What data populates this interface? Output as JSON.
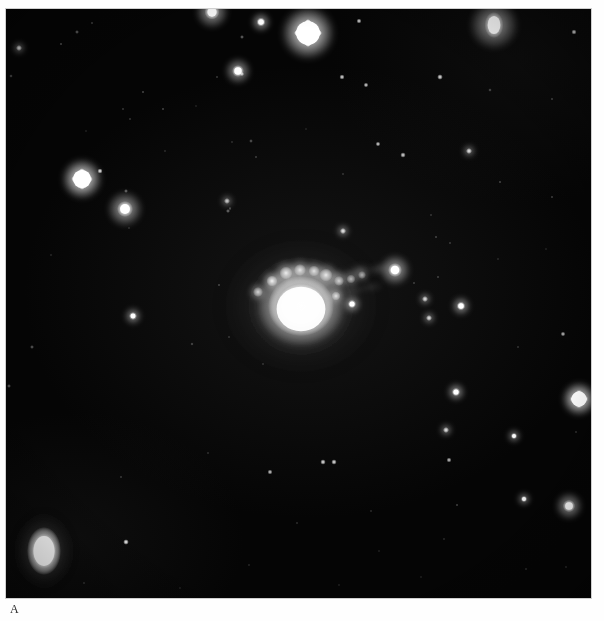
{
  "figure": {
    "panel_letter": "A",
    "panel_letter_x": 10,
    "panel_letter_y": 603,
    "page_background": "#ffffff"
  },
  "plate": {
    "name": "astronomical-photographic-plate",
    "x": 6,
    "y": 9,
    "width": 585,
    "height": 589,
    "sky_background": "#050505",
    "star_color": "#ffffff",
    "subject": "bright-peculiar-galaxy-with-knotty-tail",
    "orientation_note": "negative-inverted grayscale sky survey print"
  },
  "chart_data": {
    "type": "scatter",
    "title": "",
    "xlabel": "",
    "ylabel": "",
    "xlim": [
      0,
      585
    ],
    "ylim": [
      0,
      589
    ],
    "grid": false,
    "legend": false,
    "coordinate_space": "plate-pixels, origin at plate top-left",
    "central_object": {
      "label": "peculiar galaxy core",
      "cx": 295,
      "cy": 297,
      "core_rx": 33,
      "core_ry": 30,
      "halo_rx": 62,
      "halo_ry": 58,
      "peak_brightness": 1.0,
      "knots": [
        {
          "cx": 266,
          "cy": 272,
          "r": 5.5,
          "b": 0.92
        },
        {
          "cx": 280,
          "cy": 264,
          "r": 6.5,
          "b": 0.86
        },
        {
          "cx": 294,
          "cy": 261,
          "r": 6.0,
          "b": 0.8
        },
        {
          "cx": 308,
          "cy": 262,
          "r": 5.5,
          "b": 0.78
        },
        {
          "cx": 320,
          "cy": 266,
          "r": 6.5,
          "b": 0.84
        },
        {
          "cx": 333,
          "cy": 272,
          "r": 5.0,
          "b": 0.7
        },
        {
          "cx": 345,
          "cy": 270,
          "r": 4.5,
          "b": 0.6
        },
        {
          "cx": 356,
          "cy": 266,
          "r": 4.0,
          "b": 0.55
        },
        {
          "cx": 252,
          "cy": 283,
          "r": 5.0,
          "b": 0.72
        },
        {
          "cx": 330,
          "cy": 287,
          "r": 4.5,
          "b": 0.78
        }
      ],
      "tail": {
        "label": "wispy tidal tail / jet toward upper right",
        "points": [
          {
            "cx": 330,
            "cy": 268,
            "rx": 16,
            "ry": 9,
            "b": 0.42,
            "rot": -18
          },
          {
            "cx": 352,
            "cy": 262,
            "rx": 16,
            "ry": 8,
            "b": 0.36,
            "rot": -16
          },
          {
            "cx": 372,
            "cy": 260,
            "rx": 14,
            "ry": 7,
            "b": 0.3,
            "rot": -12
          },
          {
            "cx": 345,
            "cy": 282,
            "rx": 18,
            "ry": 7,
            "b": 0.26,
            "rot": -8
          },
          {
            "cx": 366,
            "cy": 278,
            "rx": 14,
            "ry": 6,
            "b": 0.2,
            "rot": -6
          }
        ]
      }
    },
    "bright_companion": {
      "label": "elongated bright object lower left",
      "cx": 38,
      "cy": 542,
      "rx": 17,
      "ry": 24,
      "b": 1.0
    },
    "stars": [
      {
        "x": 71,
        "y": 23,
        "r": 2.0,
        "b": 0.55,
        "shape": "round"
      },
      {
        "x": 86,
        "y": 14,
        "r": 1.4,
        "b": 0.4,
        "shape": "round"
      },
      {
        "x": 206,
        "y": 3,
        "r": 7.5,
        "b": 1.0,
        "shape": "round"
      },
      {
        "x": 255,
        "y": 13,
        "r": 4.5,
        "b": 0.95,
        "shape": "round"
      },
      {
        "x": 302,
        "y": 24,
        "r": 12.5,
        "b": 1.0,
        "shape": "diamond"
      },
      {
        "x": 488,
        "y": 16,
        "r": 11.0,
        "b": 1.0,
        "shape": "oval"
      },
      {
        "x": 353,
        "y": 12,
        "r": 2.5,
        "b": 0.7,
        "shape": "round"
      },
      {
        "x": 568,
        "y": 23,
        "r": 2.6,
        "b": 0.78,
        "shape": "round"
      },
      {
        "x": 13,
        "y": 39,
        "r": 3.0,
        "b": 0.75,
        "shape": "round"
      },
      {
        "x": 55,
        "y": 35,
        "r": 1.6,
        "b": 0.45,
        "shape": "round"
      },
      {
        "x": 5,
        "y": 67,
        "r": 1.8,
        "b": 0.45,
        "shape": "round"
      },
      {
        "x": 236,
        "y": 28,
        "r": 2.0,
        "b": 0.55,
        "shape": "round"
      },
      {
        "x": 232,
        "y": 62,
        "r": 6.0,
        "b": 0.95,
        "shape": "round"
      },
      {
        "x": 336,
        "y": 68,
        "r": 2.6,
        "b": 0.72,
        "shape": "round"
      },
      {
        "x": 360,
        "y": 76,
        "r": 2.4,
        "b": 0.68,
        "shape": "round"
      },
      {
        "x": 211,
        "y": 68,
        "r": 1.4,
        "b": 0.35,
        "shape": "round"
      },
      {
        "x": 137,
        "y": 83,
        "r": 1.6,
        "b": 0.4,
        "shape": "round"
      },
      {
        "x": 117,
        "y": 100,
        "r": 1.4,
        "b": 0.34,
        "shape": "round"
      },
      {
        "x": 236,
        "y": 65,
        "r": 2.2,
        "b": 0.6,
        "shape": "round"
      },
      {
        "x": 434,
        "y": 68,
        "r": 2.8,
        "b": 0.76,
        "shape": "round"
      },
      {
        "x": 484,
        "y": 81,
        "r": 1.8,
        "b": 0.42,
        "shape": "round"
      },
      {
        "x": 546,
        "y": 90,
        "r": 1.6,
        "b": 0.38,
        "shape": "round"
      },
      {
        "x": 157,
        "y": 100,
        "r": 1.6,
        "b": 0.38,
        "shape": "round"
      },
      {
        "x": 124,
        "y": 110,
        "r": 1.4,
        "b": 0.32,
        "shape": "round"
      },
      {
        "x": 245,
        "y": 132,
        "r": 1.9,
        "b": 0.46,
        "shape": "round"
      },
      {
        "x": 250,
        "y": 148,
        "r": 1.5,
        "b": 0.35,
        "shape": "round"
      },
      {
        "x": 76,
        "y": 170,
        "r": 9.5,
        "b": 1.0,
        "shape": "diamond"
      },
      {
        "x": 94,
        "y": 162,
        "r": 2.6,
        "b": 0.78,
        "shape": "round"
      },
      {
        "x": 119,
        "y": 200,
        "r": 8.0,
        "b": 1.0,
        "shape": "round"
      },
      {
        "x": 120,
        "y": 182,
        "r": 2.0,
        "b": 0.55,
        "shape": "round"
      },
      {
        "x": 221,
        "y": 192,
        "r": 3.0,
        "b": 0.66,
        "shape": "round"
      },
      {
        "x": 226,
        "y": 133,
        "r": 1.3,
        "b": 0.28,
        "shape": "round"
      },
      {
        "x": 159,
        "y": 142,
        "r": 1.3,
        "b": 0.26,
        "shape": "round"
      },
      {
        "x": 372,
        "y": 135,
        "r": 2.4,
        "b": 0.68,
        "shape": "round"
      },
      {
        "x": 397,
        "y": 146,
        "r": 2.7,
        "b": 0.72,
        "shape": "round"
      },
      {
        "x": 463,
        "y": 142,
        "r": 3.0,
        "b": 0.76,
        "shape": "round"
      },
      {
        "x": 494,
        "y": 173,
        "r": 1.6,
        "b": 0.38,
        "shape": "round"
      },
      {
        "x": 546,
        "y": 188,
        "r": 1.5,
        "b": 0.36,
        "shape": "round"
      },
      {
        "x": 224,
        "y": 200,
        "r": 1.4,
        "b": 0.3,
        "shape": "round"
      },
      {
        "x": 337,
        "y": 165,
        "r": 1.4,
        "b": 0.3,
        "shape": "round"
      },
      {
        "x": 222,
        "y": 202,
        "r": 2.1,
        "b": 0.55,
        "shape": "round"
      },
      {
        "x": 123,
        "y": 219,
        "r": 1.3,
        "b": 0.26,
        "shape": "round"
      },
      {
        "x": 337,
        "y": 222,
        "r": 3.1,
        "b": 0.78,
        "shape": "round"
      },
      {
        "x": 224,
        "y": 199,
        "r": 1.4,
        "b": 0.3,
        "shape": "round"
      },
      {
        "x": 425,
        "y": 206,
        "r": 1.4,
        "b": 0.3,
        "shape": "round"
      },
      {
        "x": 430,
        "y": 228,
        "r": 1.6,
        "b": 0.36,
        "shape": "round"
      },
      {
        "x": 444,
        "y": 234,
        "r": 1.5,
        "b": 0.32,
        "shape": "round"
      },
      {
        "x": 213,
        "y": 276,
        "r": 1.6,
        "b": 0.38,
        "shape": "round"
      },
      {
        "x": 389,
        "y": 261,
        "r": 7.0,
        "b": 1.0,
        "shape": "round"
      },
      {
        "x": 408,
        "y": 274,
        "r": 1.5,
        "b": 0.34,
        "shape": "round"
      },
      {
        "x": 346,
        "y": 295,
        "r": 4.2,
        "b": 0.9,
        "shape": "round"
      },
      {
        "x": 432,
        "y": 268,
        "r": 1.6,
        "b": 0.34,
        "shape": "round"
      },
      {
        "x": 419,
        "y": 290,
        "r": 3.0,
        "b": 0.74,
        "shape": "round"
      },
      {
        "x": 423,
        "y": 309,
        "r": 3.0,
        "b": 0.74,
        "shape": "round"
      },
      {
        "x": 127,
        "y": 307,
        "r": 4.0,
        "b": 0.86,
        "shape": "round"
      },
      {
        "x": 26,
        "y": 338,
        "r": 2.0,
        "b": 0.48,
        "shape": "round"
      },
      {
        "x": 3,
        "y": 377,
        "r": 2.0,
        "b": 0.48,
        "shape": "round"
      },
      {
        "x": 186,
        "y": 335,
        "r": 1.7,
        "b": 0.4,
        "shape": "round"
      },
      {
        "x": 223,
        "y": 328,
        "r": 1.4,
        "b": 0.3,
        "shape": "round"
      },
      {
        "x": 455,
        "y": 297,
        "r": 4.4,
        "b": 0.92,
        "shape": "round"
      },
      {
        "x": 557,
        "y": 325,
        "r": 2.4,
        "b": 0.6,
        "shape": "round"
      },
      {
        "x": 257,
        "y": 355,
        "r": 1.4,
        "b": 0.28,
        "shape": "round"
      },
      {
        "x": 450,
        "y": 383,
        "r": 4.2,
        "b": 0.92,
        "shape": "round"
      },
      {
        "x": 573,
        "y": 390,
        "r": 8.0,
        "b": 1.0,
        "shape": "diamond"
      },
      {
        "x": 512,
        "y": 338,
        "r": 1.4,
        "b": 0.3,
        "shape": "round"
      },
      {
        "x": 440,
        "y": 421,
        "r": 3.0,
        "b": 0.76,
        "shape": "round"
      },
      {
        "x": 508,
        "y": 427,
        "r": 3.2,
        "b": 0.78,
        "shape": "round"
      },
      {
        "x": 443,
        "y": 451,
        "r": 2.5,
        "b": 0.64,
        "shape": "round"
      },
      {
        "x": 317,
        "y": 453,
        "r": 2.7,
        "b": 0.76,
        "shape": "round"
      },
      {
        "x": 328,
        "y": 453,
        "r": 2.7,
        "b": 0.76,
        "shape": "round"
      },
      {
        "x": 264,
        "y": 463,
        "r": 2.5,
        "b": 0.66,
        "shape": "round"
      },
      {
        "x": 115,
        "y": 468,
        "r": 1.5,
        "b": 0.32,
        "shape": "round"
      },
      {
        "x": 202,
        "y": 444,
        "r": 1.4,
        "b": 0.28,
        "shape": "round"
      },
      {
        "x": 451,
        "y": 496,
        "r": 1.6,
        "b": 0.36,
        "shape": "round"
      },
      {
        "x": 518,
        "y": 490,
        "r": 3.2,
        "b": 0.8,
        "shape": "round"
      },
      {
        "x": 563,
        "y": 497,
        "r": 6.2,
        "b": 1.0,
        "shape": "round"
      },
      {
        "x": 570,
        "y": 423,
        "r": 1.4,
        "b": 0.3,
        "shape": "round"
      },
      {
        "x": 291,
        "y": 514,
        "r": 1.4,
        "b": 0.28,
        "shape": "round"
      },
      {
        "x": 365,
        "y": 502,
        "r": 1.4,
        "b": 0.26,
        "shape": "round"
      },
      {
        "x": 120,
        "y": 533,
        "r": 2.8,
        "b": 0.86,
        "shape": "round"
      },
      {
        "x": 438,
        "y": 530,
        "r": 1.3,
        "b": 0.26,
        "shape": "round"
      },
      {
        "x": 243,
        "y": 556,
        "r": 1.3,
        "b": 0.24,
        "shape": "round"
      },
      {
        "x": 520,
        "y": 560,
        "r": 1.4,
        "b": 0.28,
        "shape": "round"
      },
      {
        "x": 560,
        "y": 558,
        "r": 1.4,
        "b": 0.26,
        "shape": "round"
      },
      {
        "x": 78,
        "y": 574,
        "r": 1.4,
        "b": 0.28,
        "shape": "round"
      },
      {
        "x": 373,
        "y": 542,
        "r": 1.2,
        "b": 0.22,
        "shape": "round"
      },
      {
        "x": 333,
        "y": 576,
        "r": 1.2,
        "b": 0.22,
        "shape": "round"
      },
      {
        "x": 415,
        "y": 568,
        "r": 1.2,
        "b": 0.22,
        "shape": "round"
      },
      {
        "x": 174,
        "y": 579,
        "r": 1.2,
        "b": 0.2,
        "shape": "round"
      },
      {
        "x": 45,
        "y": 246,
        "r": 1.3,
        "b": 0.24,
        "shape": "round"
      },
      {
        "x": 80,
        "y": 122,
        "r": 1.2,
        "b": 0.22,
        "shape": "round"
      },
      {
        "x": 492,
        "y": 250,
        "r": 1.3,
        "b": 0.24,
        "shape": "round"
      },
      {
        "x": 300,
        "y": 120,
        "r": 1.2,
        "b": 0.22,
        "shape": "round"
      },
      {
        "x": 190,
        "y": 97,
        "r": 1.2,
        "b": 0.22,
        "shape": "round"
      },
      {
        "x": 540,
        "y": 240,
        "r": 1.2,
        "b": 0.22,
        "shape": "round"
      }
    ]
  }
}
